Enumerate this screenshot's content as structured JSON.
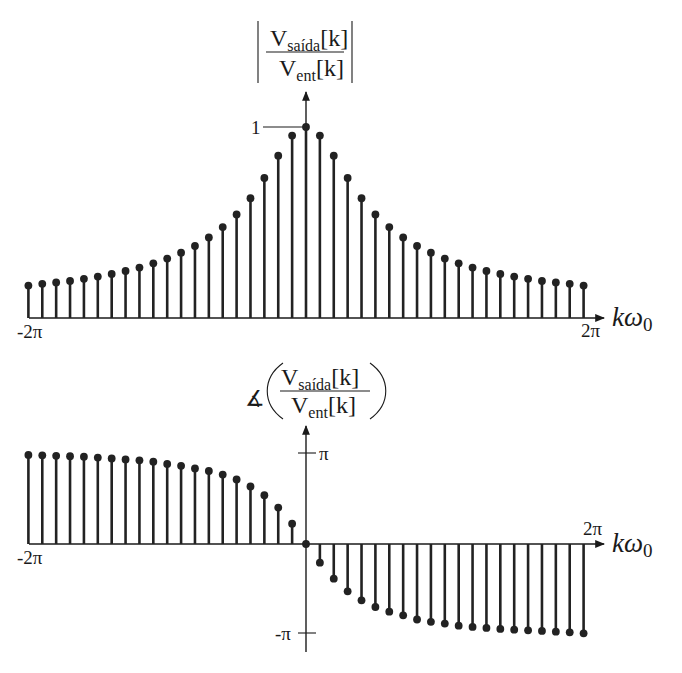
{
  "chart_data": [
    {
      "type": "stem",
      "title": {
        "wrapper": "|·|",
        "numerator_main": "V",
        "numerator_sub": "saída",
        "numerator_arg": "[k]",
        "denominator_main": "V",
        "denominator_sub": "ent",
        "denominator_arg": "[k]"
      },
      "xlabel": {
        "main": "kω",
        "sub": "0"
      },
      "x_tick_labels": {
        "left": "-2π",
        "right": "2π"
      },
      "y_tick_labels": [
        {
          "label": "1",
          "value": 1
        }
      ],
      "xlim": [
        -20,
        20
      ],
      "ylim": [
        0,
        1.12
      ],
      "k": [
        -20,
        -19,
        -18,
        -17,
        -16,
        -15,
        -14,
        -13,
        -12,
        -11,
        -10,
        -9,
        -8,
        -7,
        -6,
        -5,
        -4,
        -3,
        -2,
        -1,
        0,
        1,
        2,
        3,
        4,
        5,
        6,
        7,
        8,
        9,
        10,
        11,
        12,
        13,
        14,
        15,
        16,
        17,
        18,
        19,
        20
      ],
      "values": [
        0.17,
        0.179,
        0.186,
        0.194,
        0.205,
        0.217,
        0.231,
        0.246,
        0.264,
        0.286,
        0.311,
        0.342,
        0.377,
        0.422,
        0.476,
        0.542,
        0.627,
        0.733,
        0.85,
        0.955,
        1.0,
        0.955,
        0.85,
        0.733,
        0.627,
        0.542,
        0.476,
        0.422,
        0.377,
        0.342,
        0.311,
        0.286,
        0.264,
        0.246,
        0.231,
        0.217,
        0.205,
        0.194,
        0.186,
        0.179,
        0.17
      ],
      "grid": false
    },
    {
      "type": "stem",
      "title": {
        "angle_symbol": "∡",
        "numerator_main": "V",
        "numerator_sub": "saída",
        "numerator_arg": "[k]",
        "denominator_main": "V",
        "denominator_sub": "ent",
        "denominator_arg": "[k]"
      },
      "xlabel": {
        "main": "kω",
        "sub": "0"
      },
      "x_tick_labels": {
        "left": "-2π",
        "right": "2π"
      },
      "y_tick_labels": [
        {
          "label": "π",
          "value": 1
        },
        {
          "label": "-π",
          "value": -1
        }
      ],
      "y_units": "multiples of π",
      "xlim": [
        -20,
        20
      ],
      "ylim": [
        -1.2,
        1.2
      ],
      "k": [
        -20,
        -19,
        -18,
        -17,
        -16,
        -15,
        -14,
        -13,
        -12,
        -11,
        -10,
        -9,
        -8,
        -7,
        -6,
        -5,
        -4,
        -3,
        -2,
        -1,
        0,
        1,
        2,
        3,
        4,
        5,
        6,
        7,
        8,
        9,
        10,
        11,
        12,
        13,
        14,
        15,
        16,
        17,
        18,
        19,
        20
      ],
      "values": [
        0.99,
        0.985,
        0.98,
        0.975,
        0.97,
        0.96,
        0.95,
        0.94,
        0.93,
        0.915,
        0.89,
        0.869,
        0.84,
        0.811,
        0.771,
        0.717,
        0.64,
        0.542,
        0.405,
        0.226,
        0,
        -0.207,
        -0.385,
        -0.526,
        -0.626,
        -0.7,
        -0.752,
        -0.793,
        -0.839,
        -0.865,
        -0.884,
        -0.907,
        -0.921,
        -0.933,
        -0.944,
        -0.952,
        -0.959,
        -0.966,
        -0.974,
        -0.981,
        -0.992
      ],
      "grid": false
    }
  ]
}
